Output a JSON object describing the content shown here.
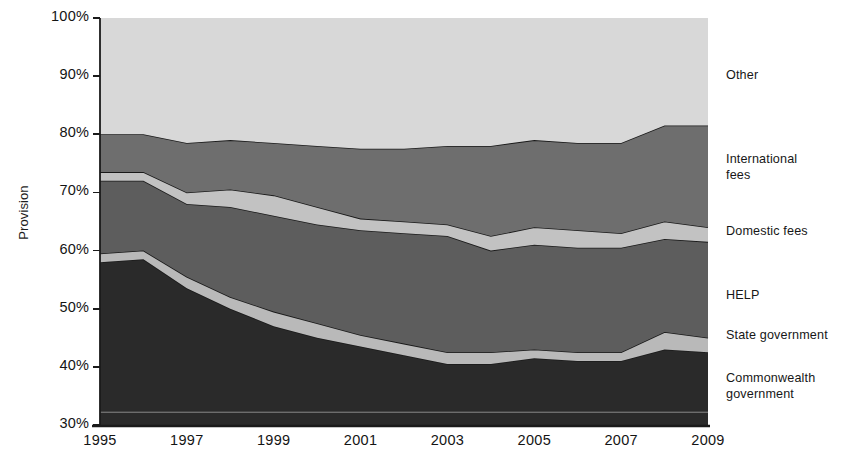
{
  "chart_data": {
    "type": "area",
    "title": "",
    "xlabel": "",
    "ylabel": "Provision",
    "stacked": true,
    "normalized_percent": true,
    "grid": false,
    "legend_position": "right",
    "xlim": [
      1995,
      2009
    ],
    "ylim": [
      30,
      100
    ],
    "x": [
      1995,
      1996,
      1997,
      1998,
      1999,
      2000,
      2001,
      2002,
      2003,
      2004,
      2005,
      2006,
      2007,
      2008,
      2009
    ],
    "xticks": [
      "1995",
      "1997",
      "1999",
      "2001",
      "2003",
      "2005",
      "2007",
      "2009"
    ],
    "yticks": [
      "30%",
      "40%",
      "50%",
      "60%",
      "70%",
      "80%",
      "90%",
      "100%"
    ],
    "series": [
      {
        "name": "Commonwealth government",
        "color": "#2a2a2a",
        "order": 1,
        "cumulative_top": [
          58.0,
          58.5,
          53.5,
          50.0,
          47.0,
          45.0,
          43.5,
          42.0,
          40.5,
          40.5,
          41.5,
          41.0,
          41.0,
          43.0,
          42.5
        ],
        "values": [
          28.0,
          28.5,
          23.5,
          20.0,
          17.0,
          15.0,
          13.5,
          12.0,
          10.5,
          10.5,
          11.5,
          11.0,
          11.0,
          13.0,
          12.5
        ]
      },
      {
        "name": "State government",
        "color": "#b9b9b9",
        "order": 2,
        "cumulative_top": [
          59.5,
          60.0,
          55.5,
          52.0,
          49.5,
          47.5,
          45.5,
          44.0,
          42.5,
          42.5,
          43.0,
          42.5,
          42.5,
          46.0,
          45.0
        ],
        "values": [
          1.5,
          1.5,
          2.0,
          2.0,
          2.5,
          2.5,
          2.0,
          2.0,
          2.0,
          2.0,
          1.5,
          1.5,
          1.5,
          3.0,
          2.5
        ]
      },
      {
        "name": "HELP",
        "color": "#5d5d5d",
        "order": 3,
        "cumulative_top": [
          72.0,
          72.0,
          68.0,
          67.5,
          66.0,
          64.5,
          63.5,
          63.0,
          62.5,
          60.0,
          61.0,
          60.5,
          60.5,
          62.0,
          61.5
        ],
        "values": [
          12.5,
          12.0,
          12.5,
          15.5,
          16.5,
          17.0,
          18.0,
          19.0,
          20.0,
          17.5,
          18.0,
          18.0,
          18.0,
          16.0,
          16.5
        ]
      },
      {
        "name": "Domestic fees",
        "color": "#c2c2c2",
        "order": 4,
        "cumulative_top": [
          73.5,
          73.5,
          70.0,
          70.5,
          69.5,
          67.5,
          65.5,
          65.0,
          64.5,
          62.5,
          64.0,
          63.5,
          63.0,
          65.0,
          64.0
        ],
        "values": [
          1.5,
          1.5,
          2.0,
          3.0,
          3.5,
          3.0,
          2.0,
          2.0,
          2.0,
          2.5,
          3.0,
          3.0,
          2.5,
          3.0,
          2.5
        ]
      },
      {
        "name": "International fees",
        "color": "#6e6e6e",
        "order": 5,
        "cumulative_top": [
          80.0,
          80.0,
          78.5,
          79.0,
          78.5,
          78.0,
          77.5,
          77.5,
          78.0,
          78.0,
          79.0,
          78.5,
          78.5,
          81.5,
          81.5
        ],
        "values": [
          6.5,
          6.5,
          8.5,
          8.5,
          9.0,
          10.5,
          12.0,
          12.5,
          13.5,
          15.5,
          15.0,
          15.0,
          15.5,
          16.5,
          17.5
        ]
      },
      {
        "name": "Other",
        "color": "#d8d8d8",
        "order": 6,
        "cumulative_top": [
          100,
          100,
          100,
          100,
          100,
          100,
          100,
          100,
          100,
          100,
          100,
          100,
          100,
          100,
          100
        ],
        "values": [
          20.0,
          20.0,
          21.5,
          21.0,
          21.5,
          22.0,
          22.5,
          22.5,
          22.0,
          22.0,
          21.0,
          21.5,
          21.5,
          18.5,
          18.5
        ]
      }
    ],
    "legend": [
      {
        "label": "Other",
        "color": "#d8d8d8"
      },
      {
        "label": "International\nfees",
        "color": "#6e6e6e"
      },
      {
        "label": "Domestic fees",
        "color": "#c2c2c2"
      },
      {
        "label": "HELP",
        "color": "#5d5d5d"
      },
      {
        "label": "State government",
        "color": "#b9b9b9"
      },
      {
        "label": "Commonwealth\ngovernment",
        "color": "#2a2a2a"
      }
    ]
  },
  "axes": {
    "y_axis_label": "Provision",
    "y_ticks": [
      "100%",
      "90%",
      "80%",
      "70%",
      "60%",
      "50%",
      "40%",
      "30%"
    ],
    "x_ticks": [
      "1995",
      "1997",
      "1999",
      "2001",
      "2003",
      "2005",
      "2007",
      "2009"
    ]
  },
  "legend_labels": {
    "other": "Other",
    "international_fees": "International\nfees",
    "domestic_fees": "Domestic fees",
    "help": "HELP",
    "state_government": "State government",
    "commonwealth_government": "Commonwealth\ngovernment"
  },
  "colors": {
    "commonwealth": "#2a2a2a",
    "state": "#b9b9b9",
    "help": "#5d5d5d",
    "domestic": "#c2c2c2",
    "international": "#6e6e6e",
    "other": "#d8d8d8",
    "axis": "#1a1a1a",
    "outline": "#1a1a1a"
  }
}
